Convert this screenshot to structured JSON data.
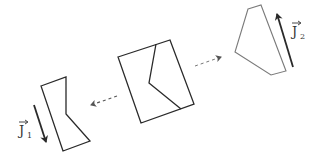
{
  "diagram": {
    "type": "polygon-split-illustration",
    "stroke_color": "#2a2a2a",
    "light_stroke_color": "#7a7a7a",
    "central_piece": {
      "outline": [
        [
          118,
          57
        ],
        [
          170,
          40
        ],
        [
          194,
          104
        ],
        [
          141,
          123
        ]
      ],
      "cut_line": [
        [
          156,
          44
        ],
        [
          149,
          83
        ],
        [
          181,
          109
        ]
      ]
    },
    "left_piece": {
      "outline": [
        [
          41,
          86
        ],
        [
          66,
          77
        ],
        [
          66,
          114
        ],
        [
          90,
          141
        ],
        [
          63,
          151
        ]
      ],
      "vector": {
        "from": [
          34,
          105
        ],
        "to": [
          46,
          142
        ]
      },
      "label": {
        "main": "J",
        "subscript": "1",
        "x": 18,
        "y": 133
      }
    },
    "right_piece": {
      "outline": [
        [
          248,
          9
        ],
        [
          261,
          5
        ],
        [
          286,
          71
        ],
        [
          271,
          75
        ],
        [
          235,
          52
        ]
      ],
      "vector": {
        "from": [
          293,
          67
        ],
        "to": [
          277,
          14
        ]
      },
      "label": {
        "main": "J",
        "subscript": "2",
        "x": 293,
        "y": 34
      }
    },
    "dashed_arrows": [
      {
        "name": "to-left",
        "from": [
          117,
          96
        ],
        "to": [
          91,
          105
        ]
      },
      {
        "name": "to-right",
        "from": [
          195,
          66
        ],
        "to": [
          221,
          57
        ]
      }
    ]
  },
  "labels": {
    "j1_main": "J",
    "j1_sub": "1",
    "j2_main": "J",
    "j2_sub": "2"
  }
}
